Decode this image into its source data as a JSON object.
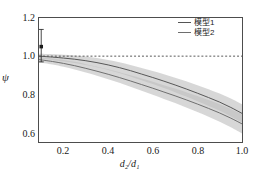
{
  "chart_data": {
    "type": "line",
    "title": "",
    "xlabel": "d₂/d₁",
    "ylabel": "ψ",
    "xlim": [
      0.09,
      1.0
    ],
    "ylim": [
      0.55,
      1.2
    ],
    "grid": false,
    "legend_position": "upper right",
    "xticks": [
      "0.2",
      "0.4",
      "0.6",
      "0.8",
      "1.0"
    ],
    "xtick_values": [
      0.2,
      0.4,
      0.6,
      0.8,
      1.0
    ],
    "yticks": [
      "0.6",
      "0.8",
      "1.0",
      "1.2"
    ],
    "ytick_values": [
      0.6,
      0.8,
      1.0,
      1.2
    ],
    "x": [
      0.09,
      0.15,
      0.2,
      0.25,
      0.3,
      0.35,
      0.4,
      0.45,
      0.5,
      0.55,
      0.6,
      0.65,
      0.7,
      0.75,
      0.8,
      0.85,
      0.9,
      0.95,
      1.0
    ],
    "series": [
      {
        "name": "模型1",
        "color": "#555555",
        "values": [
          1.0,
          0.995,
          0.99,
          0.984,
          0.976,
          0.966,
          0.954,
          0.94,
          0.924,
          0.906,
          0.888,
          0.869,
          0.849,
          0.828,
          0.806,
          0.783,
          0.759,
          0.731,
          0.7
        ],
        "band_upper": [
          1.012,
          1.01,
          1.008,
          1.004,
          0.998,
          0.99,
          0.98,
          0.968,
          0.954,
          0.938,
          0.922,
          0.905,
          0.887,
          0.868,
          0.848,
          0.827,
          0.804,
          0.778,
          0.748
        ],
        "band_lower": [
          0.988,
          0.98,
          0.972,
          0.964,
          0.954,
          0.942,
          0.928,
          0.912,
          0.894,
          0.874,
          0.854,
          0.833,
          0.811,
          0.788,
          0.764,
          0.739,
          0.714,
          0.684,
          0.652
        ]
      },
      {
        "name": "模型2",
        "color": "#6e6e6e",
        "values": [
          0.982,
          0.972,
          0.962,
          0.95,
          0.936,
          0.921,
          0.905,
          0.888,
          0.87,
          0.851,
          0.832,
          0.812,
          0.792,
          0.771,
          0.749,
          0.726,
          0.702,
          0.675,
          0.645
        ],
        "band_upper": [
          0.996,
          0.988,
          0.98,
          0.97,
          0.958,
          0.945,
          0.931,
          0.916,
          0.9,
          0.883,
          0.866,
          0.848,
          0.83,
          0.811,
          0.791,
          0.77,
          0.748,
          0.723,
          0.695
        ],
        "band_lower": [
          0.968,
          0.956,
          0.944,
          0.93,
          0.914,
          0.897,
          0.879,
          0.86,
          0.84,
          0.819,
          0.798,
          0.776,
          0.754,
          0.731,
          0.707,
          0.682,
          0.656,
          0.627,
          0.595
        ]
      }
    ],
    "reference_line": {
      "y": 1.0,
      "style": "dashed",
      "color": "#555555"
    },
    "errorbar_point": {
      "x": 0.1,
      "y": 1.05,
      "y_upper": 1.14,
      "y_lower": 0.97,
      "marker": "square",
      "color": "#1a1a1a"
    }
  },
  "legend": {
    "items": [
      {
        "label": "模型1"
      },
      {
        "label": "模型2"
      }
    ]
  },
  "colors": {
    "axis": "#4d4d4d",
    "band": "#bfbfbf",
    "series1": "#555555",
    "series2": "#6e6e6e",
    "background": "#ffffff"
  }
}
